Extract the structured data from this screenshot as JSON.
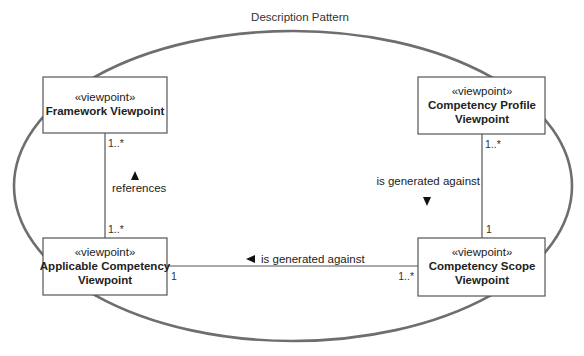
{
  "diagram": {
    "title": "Description Pattern",
    "stereotype": "«viewpoint»",
    "viewpoints": [
      {
        "id": "framework",
        "name_lines": [
          "Framework Viewpoint"
        ]
      },
      {
        "id": "competency-profile",
        "name_lines": [
          "Competency Profile",
          "Viewpoint"
        ]
      },
      {
        "id": "applicable-competency",
        "name_lines": [
          "Applicable Competency",
          "Viewpoint"
        ]
      },
      {
        "id": "competency-scope",
        "name_lines": [
          "Competency Scope",
          "Viewpoint"
        ]
      }
    ],
    "associations": [
      {
        "from": "framework",
        "to": "applicable-competency",
        "label": "references",
        "direction_arrow": "up",
        "mult_from": "1..*",
        "mult_to": "1..*"
      },
      {
        "from": "competency-profile",
        "to": "competency-scope",
        "label": "is generated against",
        "direction_arrow": "down",
        "mult_from": "1..*",
        "mult_to": "1"
      },
      {
        "from": "applicable-competency",
        "to": "competency-scope",
        "label": "is generated against",
        "direction_arrow": "left",
        "mult_from": "1",
        "mult_to": "1..*"
      }
    ],
    "colors": {
      "ellipse_stroke": "#6e6e6e",
      "box_stroke": "#555555",
      "text": "#222222",
      "background": "#ffffff"
    }
  }
}
